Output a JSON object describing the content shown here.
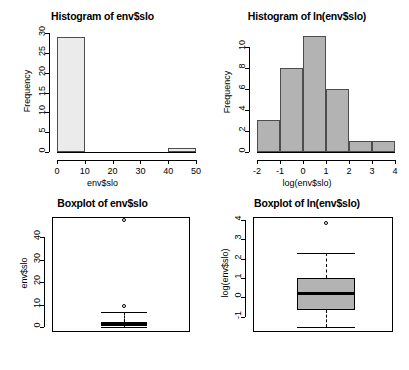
{
  "chart_data": [
    {
      "type": "bar",
      "panel": "top-left",
      "title": "Histogram of env$slo",
      "xlabel": "env$slo",
      "ylabel": "Frequency",
      "bin_edges": [
        0,
        10,
        20,
        30,
        40,
        50
      ],
      "categories": [
        "0-10",
        "10-20",
        "20-30",
        "30-40",
        "40-50"
      ],
      "values": [
        29,
        0,
        0,
        0,
        1
      ],
      "xticks": [
        "0",
        "10",
        "20",
        "30",
        "40",
        "50"
      ],
      "xtick_values": [
        0,
        10,
        20,
        30,
        40,
        50
      ],
      "yticks": [
        "0",
        "5",
        "10",
        "15",
        "20",
        "25",
        "30"
      ],
      "ytick_values": [
        0,
        5,
        10,
        15,
        20,
        25,
        30
      ],
      "xlim": [
        0,
        50
      ],
      "ylim": [
        0,
        30
      ],
      "bar_fill": "#ebebeb",
      "bar_border": "#4d4d4d",
      "grid": false,
      "legend": "none"
    },
    {
      "type": "bar",
      "panel": "top-right",
      "title": "Histogram of ln(env$slo)",
      "xlabel": "log(env$slo)",
      "ylabel": "Frequency",
      "bin_edges": [
        -2,
        -1,
        0,
        1,
        2,
        3,
        4
      ],
      "categories": [
        "-2 to -1",
        "-1 to 0",
        "0 to 1",
        "1 to 2",
        "2 to 3",
        "3 to 4"
      ],
      "values": [
        3,
        8,
        11,
        6,
        1,
        1
      ],
      "xticks": [
        "-2",
        "-1",
        "0",
        "1",
        "2",
        "3",
        "4"
      ],
      "xtick_values": [
        -2,
        -1,
        0,
        1,
        2,
        3,
        4
      ],
      "yticks": [
        "0",
        "2",
        "4",
        "6",
        "8",
        "10"
      ],
      "ytick_values": [
        0,
        2,
        4,
        6,
        8,
        10
      ],
      "xlim": [
        -2,
        4
      ],
      "ylim": [
        0,
        11
      ],
      "bar_fill": "#b3b3b3",
      "bar_border": "#4d4d4d",
      "grid": false,
      "legend": "none"
    },
    {
      "type": "boxplot",
      "panel": "bottom-left",
      "title": "Boxplot of env$slo",
      "xlabel": "",
      "ylabel": "env$slo",
      "yticks": [
        "0",
        "10",
        "20",
        "30",
        "40"
      ],
      "ytick_values": [
        0,
        10,
        20,
        30,
        40
      ],
      "ylim": [
        -2,
        49
      ],
      "box": {
        "lower_whisker": 0.2,
        "q1": 0.6,
        "median": 1.3,
        "q3": 2.6,
        "upper_whisker": 6.7,
        "outliers": [
          9.5,
          47.8
        ]
      },
      "box_fill": "#ebebeb",
      "grid": false,
      "legend": "none"
    },
    {
      "type": "boxplot",
      "panel": "bottom-right",
      "title": "Boxplot of ln(env$slo)",
      "xlabel": "",
      "ylabel": "log(env$slo)",
      "yticks": [
        "-1",
        "0",
        "1",
        "2",
        "3",
        "4"
      ],
      "ytick_values": [
        -1,
        0,
        1,
        2,
        3,
        4
      ],
      "ylim": [
        -1.8,
        4.15
      ],
      "box": {
        "lower_whisker": -1.55,
        "q1": -0.65,
        "median": 0.2,
        "q3": 1.0,
        "upper_whisker": 2.3,
        "outliers": [
          3.85
        ]
      },
      "box_fill": "#b3b3b3",
      "grid": false,
      "legend": "none"
    }
  ]
}
